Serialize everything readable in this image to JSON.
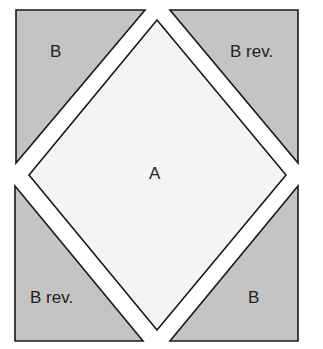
{
  "diagram": {
    "pieces": [
      {
        "id": "tl",
        "label": "B",
        "shape": "triangle",
        "fill": "#c4c4c4"
      },
      {
        "id": "tr",
        "label": "B rev.",
        "shape": "triangle",
        "fill": "#c4c4c4"
      },
      {
        "id": "center",
        "label": "A",
        "shape": "diamond",
        "fill": "#f4f4f4"
      },
      {
        "id": "bl",
        "label": "B rev.",
        "shape": "triangle",
        "fill": "#c4c4c4"
      },
      {
        "id": "br",
        "label": "B",
        "shape": "triangle",
        "fill": "#c4c4c4"
      }
    ],
    "colors": {
      "triangle_fill": "#c4c4c4",
      "diamond_fill": "#f4f4f4",
      "stroke": "#1a1a1a",
      "background": "#ffffff"
    }
  }
}
